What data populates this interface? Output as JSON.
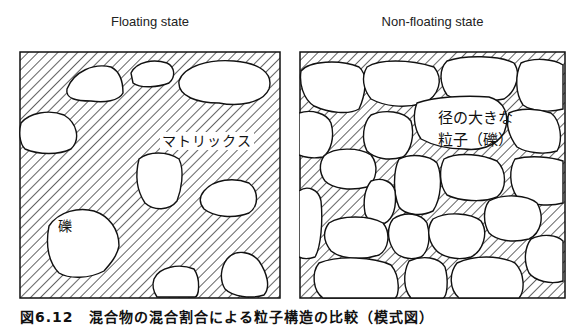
{
  "panels": {
    "left": {
      "title": "Floating state",
      "labels": {
        "matrix": "マトリックス",
        "gravel": "礫"
      }
    },
    "right": {
      "title": "Non-floating state",
      "labels": {
        "large_particle_line1": "径の大きな",
        "large_particle_line2": "粒子（礫）"
      }
    }
  },
  "caption": "図6.12　混合物の混合割合による粒子構造の比較（模式図）",
  "colors": {
    "line": "#111111",
    "background": "#ffffff",
    "clast": "#ffffff"
  }
}
